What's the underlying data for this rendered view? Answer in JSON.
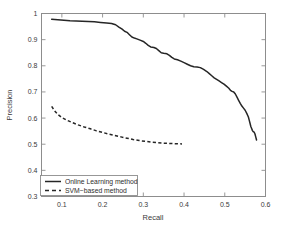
{
  "chart_data": {
    "type": "line",
    "title": "",
    "xlabel": "Recall",
    "ylabel": "Precision",
    "xlim": [
      0.05,
      0.6
    ],
    "ylim": [
      0.3,
      1.0
    ],
    "xticks": [
      0.1,
      0.2,
      0.3,
      0.4,
      0.5,
      0.6
    ],
    "xtick_labels": [
      "0.1",
      "0.2",
      "0.3",
      "0.4",
      "0.5",
      "0.6"
    ],
    "yticks": [
      0.3,
      0.4,
      0.5,
      0.6,
      0.7,
      0.8,
      0.9,
      1.0
    ],
    "ytick_labels": [
      "0.3",
      "0.4",
      "0.5",
      "0.6",
      "0.7",
      "0.8",
      "0.9",
      "1"
    ],
    "grid": false,
    "legend_position": "lower left",
    "series": [
      {
        "name": "Online Learning method",
        "style": "solid",
        "color": "#262626",
        "points": [
          [
            0.075,
            0.978
          ],
          [
            0.09,
            0.976
          ],
          [
            0.105,
            0.974
          ],
          [
            0.12,
            0.972
          ],
          [
            0.135,
            0.971
          ],
          [
            0.15,
            0.97
          ],
          [
            0.165,
            0.969
          ],
          [
            0.18,
            0.968
          ],
          [
            0.195,
            0.966
          ],
          [
            0.21,
            0.964
          ],
          [
            0.222,
            0.962
          ],
          [
            0.232,
            0.957
          ],
          [
            0.24,
            0.948
          ],
          [
            0.248,
            0.94
          ],
          [
            0.254,
            0.932
          ],
          [
            0.26,
            0.928
          ],
          [
            0.266,
            0.919
          ],
          [
            0.272,
            0.91
          ],
          [
            0.278,
            0.906
          ],
          [
            0.284,
            0.903
          ],
          [
            0.292,
            0.898
          ],
          [
            0.3,
            0.893
          ],
          [
            0.306,
            0.886
          ],
          [
            0.312,
            0.878
          ],
          [
            0.318,
            0.872
          ],
          [
            0.326,
            0.87
          ],
          [
            0.332,
            0.866
          ],
          [
            0.338,
            0.858
          ],
          [
            0.344,
            0.85
          ],
          [
            0.35,
            0.848
          ],
          [
            0.358,
            0.846
          ],
          [
            0.364,
            0.84
          ],
          [
            0.37,
            0.832
          ],
          [
            0.376,
            0.826
          ],
          [
            0.384,
            0.823
          ],
          [
            0.392,
            0.818
          ],
          [
            0.4,
            0.812
          ],
          [
            0.408,
            0.806
          ],
          [
            0.416,
            0.8
          ],
          [
            0.424,
            0.796
          ],
          [
            0.432,
            0.795
          ],
          [
            0.44,
            0.793
          ],
          [
            0.448,
            0.786
          ],
          [
            0.456,
            0.778
          ],
          [
            0.462,
            0.77
          ],
          [
            0.468,
            0.762
          ],
          [
            0.474,
            0.754
          ],
          [
            0.48,
            0.748
          ],
          [
            0.486,
            0.742
          ],
          [
            0.492,
            0.736
          ],
          [
            0.498,
            0.73
          ],
          [
            0.504,
            0.722
          ],
          [
            0.51,
            0.714
          ],
          [
            0.514,
            0.706
          ],
          [
            0.518,
            0.702
          ],
          [
            0.522,
            0.7
          ],
          [
            0.526,
            0.692
          ],
          [
            0.53,
            0.68
          ],
          [
            0.534,
            0.668
          ],
          [
            0.538,
            0.656
          ],
          [
            0.542,
            0.646
          ],
          [
            0.546,
            0.638
          ],
          [
            0.55,
            0.63
          ],
          [
            0.554,
            0.618
          ],
          [
            0.558,
            0.604
          ],
          [
            0.56,
            0.592
          ],
          [
            0.562,
            0.58
          ],
          [
            0.564,
            0.568
          ],
          [
            0.566,
            0.56
          ],
          [
            0.568,
            0.552
          ],
          [
            0.57,
            0.548
          ],
          [
            0.572,
            0.546
          ],
          [
            0.574,
            0.54
          ],
          [
            0.576,
            0.528
          ],
          [
            0.578,
            0.516
          ]
        ]
      },
      {
        "name": "SVM-based method",
        "style": "dashed",
        "color": "#262626",
        "points": [
          [
            0.075,
            0.645
          ],
          [
            0.082,
            0.628
          ],
          [
            0.09,
            0.614
          ],
          [
            0.1,
            0.602
          ],
          [
            0.112,
            0.592
          ],
          [
            0.125,
            0.583
          ],
          [
            0.14,
            0.574
          ],
          [
            0.155,
            0.566
          ],
          [
            0.17,
            0.559
          ],
          [
            0.185,
            0.551
          ],
          [
            0.2,
            0.545
          ],
          [
            0.215,
            0.539
          ],
          [
            0.23,
            0.533
          ],
          [
            0.245,
            0.528
          ],
          [
            0.26,
            0.523
          ],
          [
            0.275,
            0.518
          ],
          [
            0.29,
            0.514
          ],
          [
            0.305,
            0.511
          ],
          [
            0.32,
            0.508
          ],
          [
            0.335,
            0.506
          ],
          [
            0.35,
            0.504
          ],
          [
            0.365,
            0.503
          ],
          [
            0.38,
            0.502
          ],
          [
            0.395,
            0.501
          ]
        ]
      }
    ],
    "legend_entries": [
      {
        "label": "Online Learning method",
        "style": "solid"
      },
      {
        "label": "SVM−based method",
        "style": "dashed"
      }
    ]
  }
}
